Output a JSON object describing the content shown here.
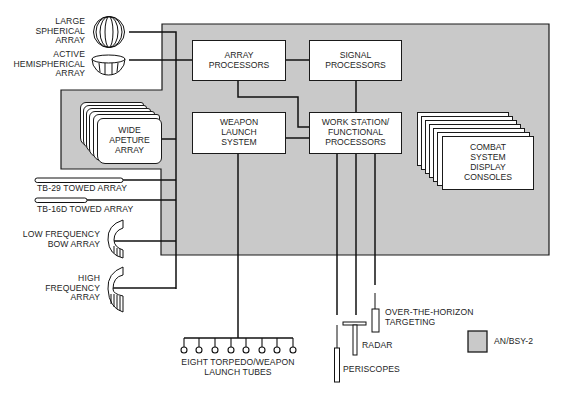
{
  "legend": {
    "label": "AN/BSY-2",
    "swatch_color": "#c9c9c9"
  },
  "colors": {
    "system_region": "#c9c9c9",
    "line": "#111111",
    "box_fill": "#ffffff"
  },
  "sensors": {
    "large_spherical": [
      "LARGE",
      "SPHERICAL",
      "ARRAY"
    ],
    "active_hemispherical": [
      "ACTIVE",
      "HEMISPHERICAL",
      "ARRAY"
    ],
    "wide_aperture": [
      "WIDE",
      "APETURE",
      "ARRAY"
    ],
    "tb29": "TB-29 TOWED ARRAY",
    "tb16d": "TB-16D TOWED ARRAY",
    "low_freq_bow": [
      "LOW FREQUENCY",
      "BOW ARRAY"
    ],
    "high_freq": [
      "HIGH",
      "FREQUENCY",
      "ARRAY"
    ]
  },
  "processors": {
    "array": [
      "ARRAY",
      "PROCESSORS"
    ],
    "signal": [
      "SIGNAL",
      "PROCESSORS"
    ],
    "weapon_launch": [
      "WEAPON",
      "LAUNCH",
      "SYSTEM"
    ],
    "work_station": [
      "WORK STATION/",
      "FUNCTIONAL",
      "PROCESSORS"
    ],
    "display_consoles": [
      "COMBAT",
      "SYSTEM",
      "DISPLAY",
      "CONSOLES"
    ]
  },
  "outputs": {
    "torpedo_tubes": [
      "EIGHT TORPEDO/WEAPON",
      "LAUNCH TUBES"
    ],
    "torpedo_tube_count": 8,
    "oth": [
      "OVER-THE-HORIZON",
      "TARGETING"
    ],
    "radar": "RADAR",
    "periscopes": "PERISCOPES"
  }
}
